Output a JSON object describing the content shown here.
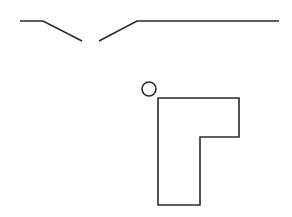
{
  "diagram": {
    "background": "#ffffff",
    "stroke_color": "#2a2a2a",
    "stroke_width": 1.6,
    "left_segment": {
      "points": "20,21 43,21 82,41"
    },
    "right_segment": {
      "points": "99,41 137,21 279,21"
    },
    "circle": {
      "cx": 149,
      "cy": 89,
      "r": 7
    },
    "l_shape": {
      "points": "158,98 239,98 239,137 200,137 200,205 158,205"
    }
  }
}
